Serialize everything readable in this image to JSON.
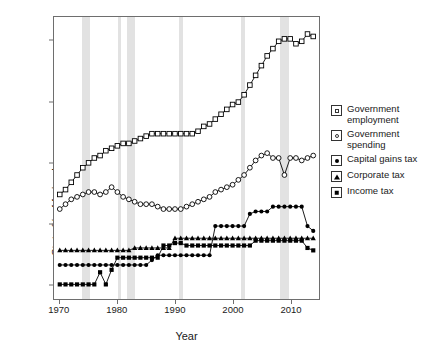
{
  "chart_data": {
    "type": "line",
    "title": "",
    "xlabel": "Year",
    "ylabel": "State % of federal",
    "xlim": [
      1969,
      2015
    ],
    "ylim": [
      -6,
      110
    ],
    "yticks": [
      0,
      25,
      50,
      75,
      100
    ],
    "xticks": [
      1970,
      1980,
      1990,
      2000,
      2010
    ],
    "grid": false,
    "legend_position": "right-outside",
    "x": [
      1970,
      1971,
      1972,
      1973,
      1974,
      1975,
      1976,
      1977,
      1978,
      1979,
      1980,
      1981,
      1982,
      1983,
      1984,
      1985,
      1986,
      1987,
      1988,
      1989,
      1990,
      1991,
      1992,
      1993,
      1994,
      1995,
      1996,
      1997,
      1998,
      1999,
      2000,
      2001,
      2002,
      2003,
      2004,
      2005,
      2006,
      2007,
      2008,
      2009,
      2010,
      2011,
      2012,
      2013,
      2014
    ],
    "shaded_bands": [
      {
        "start": 1973.9,
        "end": 1975.2
      },
      {
        "start": 1980.0,
        "end": 1980.6
      },
      {
        "start": 1981.6,
        "end": 1982.9
      },
      {
        "start": 1990.6,
        "end": 1991.2
      },
      {
        "start": 2001.2,
        "end": 2001.9
      },
      {
        "start": 2007.9,
        "end": 2009.5
      }
    ],
    "shaded_band_color": "#e2e2e2",
    "series": [
      {
        "name": "Government employment",
        "marker": "open-square",
        "color": "#000000",
        "values": [
          37,
          39,
          42,
          45,
          48,
          50,
          52,
          53,
          55,
          56,
          57,
          58,
          58,
          59,
          60,
          61,
          62,
          62,
          62,
          62,
          62,
          62,
          62,
          62,
          63,
          65,
          66,
          68,
          70,
          72,
          74,
          75,
          78,
          82,
          86,
          90,
          94,
          97,
          100,
          101,
          101,
          99,
          100,
          103,
          102
        ]
      },
      {
        "name": "Government spending",
        "marker": "open-circle",
        "color": "#000000",
        "values": [
          31,
          33,
          35,
          36,
          37,
          38,
          38,
          37,
          38,
          40,
          38,
          36,
          35,
          34,
          33,
          33,
          33,
          32,
          31,
          31,
          31,
          31,
          32,
          33,
          34,
          35,
          36,
          38,
          39,
          40,
          41,
          43,
          45,
          48,
          51,
          53,
          54,
          52,
          52,
          45,
          52,
          52,
          51,
          52,
          53
        ]
      },
      {
        "name": "Capital gains tax",
        "marker": "filled-circle",
        "color": "#000000",
        "values": [
          8,
          8,
          8,
          8,
          8,
          8,
          8,
          8,
          8,
          8,
          8,
          8,
          8,
          8,
          8,
          8,
          10,
          12,
          12,
          12,
          12,
          12,
          12,
          12,
          12,
          12,
          12,
          24,
          24,
          24,
          24,
          24,
          24,
          29,
          30,
          30,
          30,
          32,
          32,
          32,
          32,
          32,
          32,
          24,
          22
        ]
      },
      {
        "name": "Corporate tax",
        "marker": "filled-triangle",
        "color": "#000000",
        "values": [
          14,
          14,
          14,
          14,
          14,
          14,
          14,
          14,
          14,
          14,
          14,
          14,
          14,
          15,
          15,
          15,
          15,
          15,
          15,
          15,
          19,
          19,
          19,
          19,
          19,
          19,
          19,
          19,
          19,
          19,
          19,
          19,
          19,
          19,
          19,
          19,
          19,
          19,
          19,
          19,
          19,
          19,
          19,
          19,
          19
        ]
      },
      {
        "name": "Income tax",
        "marker": "filled-square",
        "color": "#000000",
        "values": [
          0,
          0,
          0,
          0,
          0,
          0,
          0,
          5,
          0,
          6,
          11,
          11,
          11,
          11,
          11,
          11,
          11,
          11,
          16,
          16,
          17,
          17,
          16,
          16,
          16,
          16,
          16,
          16,
          16,
          16,
          16,
          16,
          16,
          16,
          18,
          18,
          18,
          18,
          18,
          18,
          18,
          18,
          18,
          15,
          14
        ]
      }
    ]
  },
  "legend": {
    "items": [
      {
        "label_line1": "Government",
        "label_line2": "employment",
        "marker": "open-square"
      },
      {
        "label_line1": "Government",
        "label_line2": "spending",
        "marker": "open-circle"
      },
      {
        "label_line1": "Capital gains tax",
        "label_line2": "",
        "marker": "filled-circle"
      },
      {
        "label_line1": "Corporate tax",
        "label_line2": "",
        "marker": "filled-triangle"
      },
      {
        "label_line1": "Income tax",
        "label_line2": "",
        "marker": "filled-square"
      }
    ]
  },
  "axes": {
    "ylabel": "State % of federal",
    "xlabel": "Year",
    "ytick_labels": [
      "100",
      "75",
      "50",
      "25",
      "0"
    ],
    "xtick_labels": [
      "1970",
      "1980",
      "1990",
      "2000",
      "2010"
    ]
  }
}
